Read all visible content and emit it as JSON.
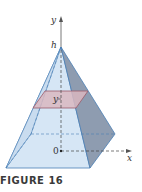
{
  "figure": {
    "caption": "FIGURE 16",
    "labels": {
      "y_axis": "y",
      "x_axis": "x",
      "apex": "h",
      "origin": "0",
      "cross_section": "y"
    },
    "colors": {
      "front_face": "#d6e6f5",
      "right_face": "#8e9cb0",
      "edge": "#4a7fb5",
      "cross_section": "#d9b7c0",
      "cross_section_edge": "#9b5a6a",
      "axis": "#555555"
    }
  }
}
